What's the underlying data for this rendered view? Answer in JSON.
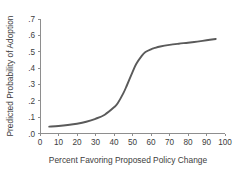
{
  "chart_data": {
    "type": "line",
    "title": "",
    "subtitle": "",
    "xlabel": "Percent Favoring Proposed Policy Change",
    "ylabel": "Predicted Probability of Adoption",
    "xlim": [
      0,
      100
    ],
    "ylim": [
      0,
      0.7
    ],
    "grid": false,
    "legend": false,
    "legend_position": "none",
    "xticks": [
      0,
      10,
      20,
      30,
      40,
      50,
      60,
      70,
      80,
      90,
      100
    ],
    "xtick_labels": [
      "0",
      "10",
      "20",
      "30",
      "40",
      "50",
      "60",
      "70",
      "80",
      "90",
      "100"
    ],
    "yticks": [
      0.0,
      0.1,
      0.2,
      0.3,
      0.4,
      0.5,
      0.6,
      0.7
    ],
    "ytick_labels": [
      ".0",
      ".1",
      ".2",
      ".3",
      ".4",
      ".5",
      ".6",
      ".7"
    ],
    "series": [
      {
        "name": "Predicted probability",
        "color": "#5a5a5a",
        "x": [
          5,
          10,
          15,
          20,
          25,
          30,
          35,
          40,
          42,
          45,
          47,
          50,
          52,
          55,
          57,
          60,
          62,
          65,
          70,
          75,
          80,
          85,
          90,
          95
        ],
        "values": [
          0.042,
          0.046,
          0.052,
          0.06,
          0.072,
          0.09,
          0.115,
          0.16,
          0.185,
          0.245,
          0.295,
          0.375,
          0.425,
          0.475,
          0.498,
          0.515,
          0.523,
          0.532,
          0.542,
          0.549,
          0.555,
          0.562,
          0.57,
          0.578
        ]
      }
    ]
  },
  "axes": {
    "x_title": "Percent Favoring Proposed Policy Change",
    "y_title": "Predicted Probability of Adoption"
  }
}
